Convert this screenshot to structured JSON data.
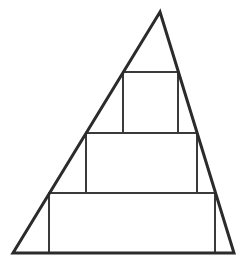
{
  "diagram": {
    "colors": {
      "background": "#ffffff",
      "triangle_stroke": "#2b2b2b",
      "rect_stroke": "#3a3a3a"
    },
    "triangle": {
      "apex": [
        160,
        12
      ],
      "bottom_left": [
        13,
        253
      ],
      "bottom_right": [
        234,
        253
      ],
      "stroke_width": 3
    },
    "rectangles": [
      {
        "name": "top-rectangle",
        "x": 123,
        "y": 72,
        "width": 55,
        "height": 61
      },
      {
        "name": "middle-rectangle",
        "x": 86,
        "y": 133,
        "width": 111,
        "height": 60
      },
      {
        "name": "bottom-rectangle",
        "x": 49,
        "y": 193,
        "width": 166,
        "height": 60
      }
    ],
    "rect_stroke_width": 2
  }
}
